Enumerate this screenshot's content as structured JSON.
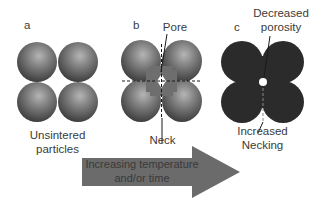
{
  "panels": [
    {
      "id": "a",
      "letter": "a",
      "caption_line1": "Unsintered",
      "caption_line2": "particles"
    },
    {
      "id": "b",
      "letter": "b",
      "top_label": "Pore",
      "bottom_label": "Neck"
    },
    {
      "id": "c",
      "letter": "c",
      "top_label_line1": "Decreased",
      "top_label_line2": "porosity",
      "bottom_label_line1": "Increased",
      "bottom_label_line2": "Necking"
    }
  ],
  "arrow": {
    "line1": "Increasing temperature",
    "line2": "and/or time",
    "color": "#6b6b6b"
  },
  "colors": {
    "sphere": "#7a7a7a",
    "sphere_dark": "#3c3c3c",
    "dense": "#2a2a2a"
  }
}
